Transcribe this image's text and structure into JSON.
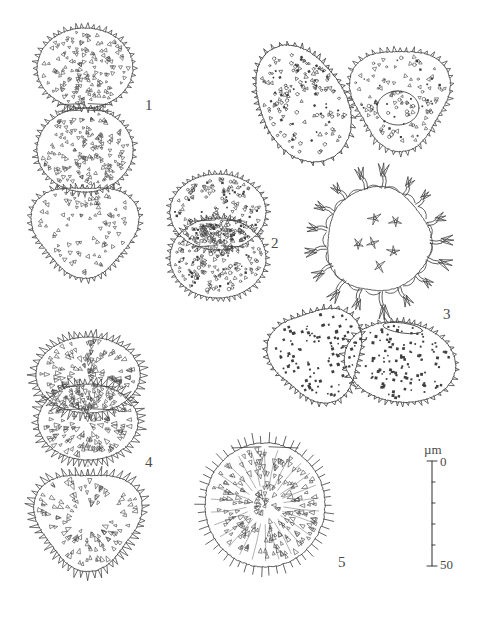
{
  "plate": {
    "kind": "pollen-micrograph-line-drawing-plate",
    "background_color": "#ffffff",
    "ink_color": "#3f3f3f",
    "width": 481,
    "height": 623
  },
  "figure_labels": [
    {
      "text": "1",
      "x": 145,
      "y": 98
    },
    {
      "text": "2",
      "x": 271,
      "y": 236
    },
    {
      "text": "3",
      "x": 443,
      "y": 307
    },
    {
      "text": "4",
      "x": 145,
      "y": 455
    },
    {
      "text": "5",
      "x": 338,
      "y": 555
    }
  ],
  "scale_bar": {
    "unit_label": "µm",
    "top_label": "0",
    "bottom_label": "50",
    "unit_x": 424,
    "unit_y": 443,
    "top_label_x": 440,
    "top_label_y": 455,
    "bottom_label_x": 440,
    "bottom_label_y": 558,
    "axis_x": 432,
    "axis_top_y": 461,
    "axis_bottom_y": 566,
    "major_tick_half_width": 5,
    "minor_tick_width": 3,
    "minor_tick_count": 4
  },
  "specimens": [
    {
      "id": "specimen-1-polar-upper",
      "figure": "1",
      "view": "polar-upper-hemisphere",
      "shape": "subcircular",
      "cx": 85,
      "cy": 68,
      "rx": 48,
      "ry": 40,
      "ornament": "echinate-scabrate",
      "spine_count": 46,
      "interior_dots": 150
    },
    {
      "id": "specimen-1-polar-lower",
      "figure": "1",
      "view": "polar-lower-hemisphere",
      "shape": "subcircular",
      "cx": 85,
      "cy": 150,
      "rx": 48,
      "ry": 42,
      "ornament": "echinate-scabrate",
      "spine_count": 48,
      "interior_dots": 160
    },
    {
      "id": "specimen-1-equatorial",
      "figure": "1",
      "view": "equatorial-triangular",
      "shape": "rounded-triangular",
      "cx": 85,
      "cy": 230,
      "rx": 52,
      "ry": 45,
      "ornament": "echinate-scabrate",
      "spine_count": 50,
      "interior_dots": 90
    },
    {
      "id": "specimen-2-upper",
      "figure": "2",
      "view": "polar-upper-hemisphere",
      "shape": "subcircular",
      "cx": 218,
      "cy": 212,
      "rx": 48,
      "ry": 38,
      "ornament": "echinate-dense-scabrate",
      "spine_count": 46,
      "interior_dots": 185
    },
    {
      "id": "specimen-2-lower",
      "figure": "2",
      "view": "polar-lower-hemisphere",
      "shape": "subcircular",
      "cx": 218,
      "cy": 258,
      "rx": 48,
      "ry": 40,
      "ornament": "echinate-dense-scabrate",
      "spine_count": 48,
      "interior_dots": 195
    },
    {
      "id": "specimen-upper-right-a",
      "figure": "1",
      "view": "oblique-obovate",
      "shape": "obovate-oblique",
      "cx": 298,
      "cy": 95,
      "rx": 44,
      "ry": 58,
      "rotation": -28,
      "ornament": "echinate-verrucate",
      "spine_count": 44,
      "interior_dots": 150
    },
    {
      "id": "specimen-upper-right-b",
      "figure": "1",
      "view": "equatorial-with-pore",
      "shape": "rounded-triangular",
      "cx": 400,
      "cy": 98,
      "rx": 48,
      "ry": 50,
      "ornament": "echinate-verrucate",
      "spine_count": 48,
      "interior_dots": 120,
      "pore": {
        "cx": 398,
        "cy": 108,
        "rx": 21,
        "ry": 17
      }
    },
    {
      "id": "specimen-3-polar",
      "figure": "3",
      "view": "polar-fenestrate-echinate",
      "shape": "circular",
      "cx": 378,
      "cy": 240,
      "r_inner": 52,
      "r_outer": 74,
      "ornament": "coarse-branched-spine-crown",
      "crown_element_count": 17,
      "inner_stellate_count": 6
    },
    {
      "id": "specimen-3-equatorial-left",
      "figure": "3",
      "view": "equatorial-triangular",
      "shape": "rounded-triangular",
      "cx": 318,
      "cy": 355,
      "rx": 46,
      "ry": 46,
      "rotation": -18,
      "ornament": "echinate-punctate",
      "spine_count": 44,
      "interior_dots": 110
    },
    {
      "id": "specimen-3-equatorial-right",
      "figure": "3",
      "view": "equatorial-ellipsoidal",
      "shape": "broad-ellipsoidal",
      "cx": 400,
      "cy": 362,
      "rx": 56,
      "ry": 40,
      "rotation": 8,
      "ornament": "echinate-punctate",
      "spine_count": 46,
      "interior_dots": 120,
      "pore": {
        "cx": 398,
        "cy": 328,
        "rx": 20,
        "ry": 5
      }
    },
    {
      "id": "specimen-4-upper",
      "figure": "4",
      "view": "polar-upper-hemisphere",
      "shape": "subcircular",
      "cx": 88,
      "cy": 375,
      "rx": 52,
      "ry": 38,
      "ornament": "echinate-large-triangular-spines",
      "spine_count": 50,
      "interior_dots": 140
    },
    {
      "id": "specimen-4-lower",
      "figure": "4",
      "view": "polar-lower-hemisphere",
      "shape": "subcircular",
      "cx": 88,
      "cy": 422,
      "rx": 50,
      "ry": 38,
      "ornament": "echinate-large-triangular-spines",
      "spine_count": 50,
      "interior_dots": 140
    },
    {
      "id": "specimen-4-equatorial",
      "figure": "4",
      "view": "equatorial-triangular",
      "shape": "rounded-triangular",
      "cx": 88,
      "cy": 520,
      "rx": 52,
      "ry": 48,
      "ornament": "echinate-large-triangular-spines",
      "spine_count": 52,
      "interior_dots": 110
    },
    {
      "id": "specimen-5",
      "figure": "5",
      "view": "polar-spinulose",
      "shape": "subcircular",
      "cx": 265,
      "cy": 505,
      "rx": 60,
      "ry": 62,
      "ornament": "long-spinulose-radiate",
      "spine_count": 54,
      "interior_dots": 200
    }
  ]
}
